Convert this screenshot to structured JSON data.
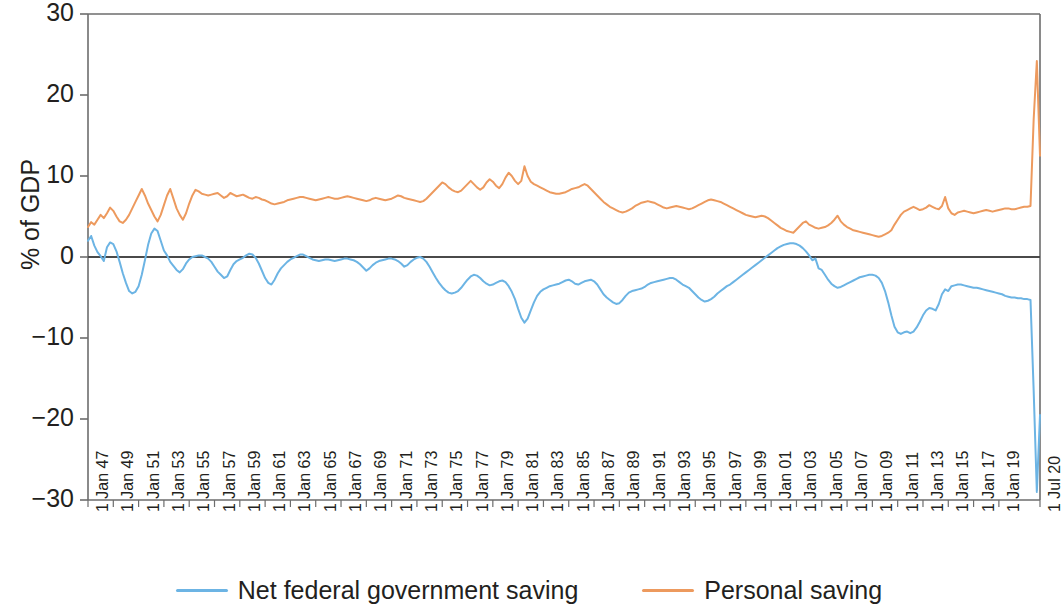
{
  "chart_data": {
    "type": "line",
    "title": "",
    "subtitle": "",
    "xlabel": "",
    "ylabel": "% of GDP",
    "ylim": [
      -30,
      30
    ],
    "yticks": [
      30,
      20,
      10,
      0,
      -10,
      -20,
      -30
    ],
    "ytick_labels": [
      "30",
      "20",
      "10",
      "0",
      "−10",
      "−20",
      "−30"
    ],
    "grid": false,
    "zero_line": true,
    "legend_position": "bottom-center",
    "x_unit": "quarter",
    "x_start": "1 Jan 47",
    "x_end": "1 Jul 20",
    "xtick_labels": [
      "1 Jan 47",
      "1 Jan 49",
      "1 Jan 51",
      "1 Jan 53",
      "1 Jan 55",
      "1 Jan 57",
      "1 Jan 59",
      "1 Jan 61",
      "1 Jan 63",
      "1 Jan 65",
      "1 Jan 67",
      "1 Jan 69",
      "1 Jan 71",
      "1 Jan 73",
      "1 Jan 75",
      "1 Jan 77",
      "1 Jan 79",
      "1 Jan 81",
      "1 Jan 83",
      "1 Jan 85",
      "1 Jan 87",
      "1 Jan 89",
      "1 Jan 91",
      "1 Jan 93",
      "1 Jan 95",
      "1 Jan 97",
      "1 Jan 99",
      "1 Jan 01",
      "1 Jan 03",
      "1 Jan 05",
      "1 Jan 07",
      "1 Jan 09",
      "1 Jan 11",
      "1 Jan 13",
      "1 Jan 15",
      "1 Jan 17",
      "1 Jan 19",
      "1 Jul 20"
    ],
    "colors": {
      "net_federal_government_saving": "#6CB4E4",
      "personal_saving": "#ED9A5E",
      "axis": "#6d6d6d",
      "zero_line": "#4a4a4a",
      "text": "#231f20"
    },
    "series": [
      {
        "name": "Net federal government saving",
        "color": "#6CB4E4",
        "x_first_year": 1947.0,
        "x_step_years": 0.25,
        "values": [
          2.0,
          2.6,
          1.4,
          0.6,
          0.1,
          -0.5,
          1.2,
          1.8,
          1.6,
          0.7,
          -0.6,
          -2.0,
          -3.2,
          -4.2,
          -4.5,
          -4.3,
          -3.6,
          -2.2,
          -0.4,
          1.5,
          2.9,
          3.5,
          3.2,
          2.0,
          0.8,
          0.2,
          -0.6,
          -1.1,
          -1.6,
          -1.9,
          -1.5,
          -0.8,
          -0.3,
          0.0,
          0.1,
          0.2,
          0.2,
          0.0,
          -0.2,
          -0.6,
          -1.2,
          -1.8,
          -2.2,
          -2.6,
          -2.4,
          -1.6,
          -0.9,
          -0.5,
          -0.3,
          -0.1,
          0.2,
          0.4,
          0.3,
          -0.1,
          -0.8,
          -1.7,
          -2.6,
          -3.2,
          -3.4,
          -2.8,
          -2.0,
          -1.4,
          -1.0,
          -0.6,
          -0.3,
          -0.1,
          0.1,
          0.3,
          0.3,
          0.1,
          -0.1,
          -0.3,
          -0.4,
          -0.5,
          -0.4,
          -0.3,
          -0.3,
          -0.4,
          -0.5,
          -0.4,
          -0.3,
          -0.2,
          -0.2,
          -0.3,
          -0.4,
          -0.6,
          -0.9,
          -1.3,
          -1.7,
          -1.4,
          -1.0,
          -0.7,
          -0.5,
          -0.4,
          -0.3,
          -0.2,
          -0.2,
          -0.3,
          -0.5,
          -0.8,
          -1.2,
          -1.0,
          -0.6,
          -0.3,
          -0.1,
          0.0,
          -0.2,
          -0.6,
          -1.2,
          -1.9,
          -2.6,
          -3.2,
          -3.7,
          -4.1,
          -4.4,
          -4.5,
          -4.4,
          -4.2,
          -3.8,
          -3.3,
          -2.8,
          -2.4,
          -2.2,
          -2.3,
          -2.6,
          -3.0,
          -3.3,
          -3.5,
          -3.4,
          -3.2,
          -3.0,
          -2.9,
          -3.1,
          -3.6,
          -4.3,
          -5.2,
          -6.4,
          -7.5,
          -8.1,
          -7.6,
          -6.6,
          -5.6,
          -4.8,
          -4.3,
          -4.0,
          -3.8,
          -3.6,
          -3.5,
          -3.4,
          -3.3,
          -3.1,
          -2.9,
          -2.8,
          -3.0,
          -3.3,
          -3.4,
          -3.2,
          -3.0,
          -2.9,
          -2.8,
          -3.0,
          -3.4,
          -4.0,
          -4.6,
          -5.0,
          -5.3,
          -5.6,
          -5.8,
          -5.7,
          -5.3,
          -4.8,
          -4.4,
          -4.2,
          -4.1,
          -4.0,
          -3.9,
          -3.7,
          -3.4,
          -3.2,
          -3.1,
          -3.0,
          -2.9,
          -2.8,
          -2.7,
          -2.6,
          -2.6,
          -2.8,
          -3.1,
          -3.4,
          -3.6,
          -3.8,
          -4.2,
          -4.6,
          -5.0,
          -5.3,
          -5.5,
          -5.4,
          -5.2,
          -4.9,
          -4.5,
          -4.2,
          -3.9,
          -3.6,
          -3.4,
          -3.1,
          -2.8,
          -2.5,
          -2.2,
          -1.9,
          -1.6,
          -1.3,
          -1.0,
          -0.7,
          -0.4,
          -0.1,
          0.2,
          0.5,
          0.8,
          1.1,
          1.3,
          1.5,
          1.6,
          1.7,
          1.7,
          1.6,
          1.4,
          1.1,
          0.7,
          0.2,
          -0.4,
          -0.2,
          -1.4,
          -1.6,
          -2.2,
          -2.8,
          -3.3,
          -3.6,
          -3.8,
          -3.7,
          -3.5,
          -3.3,
          -3.1,
          -2.9,
          -2.7,
          -2.5,
          -2.4,
          -2.3,
          -2.2,
          -2.2,
          -2.3,
          -2.6,
          -3.2,
          -4.2,
          -5.6,
          -7.2,
          -8.6,
          -9.3,
          -9.5,
          -9.3,
          -9.2,
          -9.4,
          -9.2,
          -8.7,
          -8.0,
          -7.2,
          -6.6,
          -6.3,
          -6.4,
          -6.6,
          -5.8,
          -4.6,
          -4.0,
          -4.2,
          -3.6,
          -3.5,
          -3.4,
          -3.4,
          -3.5,
          -3.6,
          -3.7,
          -3.8,
          -3.8,
          -3.9,
          -4.0,
          -4.1,
          -4.2,
          -4.3,
          -4.4,
          -4.5,
          -4.6,
          -4.8,
          -4.9,
          -5.0,
          -5.0,
          -5.1,
          -5.1,
          -5.2,
          -5.2,
          -5.3,
          -16.5,
          -29.0,
          -19.5
        ]
      },
      {
        "name": "Personal saving",
        "color": "#ED9A5E",
        "x_first_year": 1947.0,
        "x_step_years": 0.25,
        "values": [
          3.7,
          4.3,
          4.0,
          4.6,
          5.2,
          4.8,
          5.4,
          6.1,
          5.7,
          5.0,
          4.4,
          4.2,
          4.6,
          5.2,
          6.0,
          6.8,
          7.6,
          8.4,
          7.6,
          6.6,
          5.8,
          5.0,
          4.4,
          5.2,
          6.4,
          7.6,
          8.4,
          7.2,
          6.0,
          5.2,
          4.6,
          5.4,
          6.6,
          7.6,
          8.3,
          8.1,
          7.8,
          7.7,
          7.6,
          7.7,
          7.8,
          7.9,
          7.6,
          7.3,
          7.5,
          7.9,
          7.7,
          7.5,
          7.6,
          7.7,
          7.5,
          7.3,
          7.2,
          7.4,
          7.3,
          7.1,
          7.0,
          6.8,
          6.6,
          6.5,
          6.6,
          6.7,
          6.8,
          7.0,
          7.1,
          7.2,
          7.3,
          7.4,
          7.4,
          7.3,
          7.2,
          7.1,
          7.0,
          7.1,
          7.2,
          7.3,
          7.4,
          7.3,
          7.2,
          7.2,
          7.3,
          7.4,
          7.5,
          7.4,
          7.3,
          7.2,
          7.1,
          7.0,
          6.9,
          7.0,
          7.2,
          7.3,
          7.2,
          7.1,
          7.0,
          7.1,
          7.2,
          7.4,
          7.6,
          7.5,
          7.3,
          7.2,
          7.1,
          7.0,
          6.9,
          6.8,
          6.9,
          7.2,
          7.6,
          8.0,
          8.4,
          8.8,
          9.2,
          9.0,
          8.6,
          8.3,
          8.1,
          8.0,
          8.2,
          8.6,
          9.0,
          9.4,
          9.0,
          8.6,
          8.3,
          8.6,
          9.2,
          9.6,
          9.3,
          8.8,
          8.5,
          9.0,
          9.8,
          10.4,
          10.0,
          9.4,
          9.0,
          9.4,
          11.2,
          10.0,
          9.3,
          9.0,
          8.8,
          8.6,
          8.4,
          8.2,
          8.0,
          7.9,
          7.8,
          7.8,
          7.9,
          8.0,
          8.2,
          8.4,
          8.5,
          8.6,
          8.8,
          9.0,
          8.8,
          8.4,
          8.0,
          7.6,
          7.2,
          6.8,
          6.5,
          6.2,
          6.0,
          5.8,
          5.6,
          5.5,
          5.6,
          5.8,
          6.0,
          6.3,
          6.5,
          6.7,
          6.8,
          6.9,
          6.8,
          6.7,
          6.5,
          6.3,
          6.1,
          6.0,
          6.1,
          6.2,
          6.3,
          6.2,
          6.1,
          6.0,
          5.9,
          6.0,
          6.2,
          6.4,
          6.6,
          6.8,
          7.0,
          7.1,
          7.0,
          6.9,
          6.8,
          6.6,
          6.4,
          6.2,
          6.0,
          5.8,
          5.6,
          5.4,
          5.2,
          5.1,
          5.0,
          4.9,
          5.0,
          5.1,
          5.0,
          4.8,
          4.5,
          4.2,
          3.9,
          3.6,
          3.4,
          3.2,
          3.1,
          3.0,
          3.4,
          3.8,
          4.2,
          4.4,
          4.0,
          3.8,
          3.6,
          3.5,
          3.6,
          3.7,
          3.9,
          4.2,
          4.6,
          5.1,
          4.4,
          4.0,
          3.7,
          3.5,
          3.3,
          3.2,
          3.1,
          3.0,
          2.9,
          2.8,
          2.7,
          2.6,
          2.5,
          2.6,
          2.8,
          3.0,
          3.3,
          4.0,
          4.6,
          5.2,
          5.6,
          5.8,
          6.0,
          6.2,
          6.0,
          5.8,
          5.9,
          6.1,
          6.4,
          6.2,
          6.0,
          5.9,
          6.3,
          7.4,
          6.0,
          5.4,
          5.2,
          5.5,
          5.6,
          5.7,
          5.6,
          5.5,
          5.4,
          5.5,
          5.6,
          5.7,
          5.8,
          5.7,
          5.6,
          5.7,
          5.8,
          5.9,
          6.0,
          6.0,
          5.9,
          5.9,
          6.0,
          6.1,
          6.2,
          6.2,
          6.3,
          17.0,
          24.2,
          12.5
        ]
      }
    ],
    "annotations": []
  },
  "legend": {
    "items": [
      {
        "label": "Net federal government saving",
        "color": "#6CB4E4"
      },
      {
        "label": "Personal saving",
        "color": "#ED9A5E"
      }
    ]
  },
  "axes": {
    "y_title": "% of GDP"
  }
}
